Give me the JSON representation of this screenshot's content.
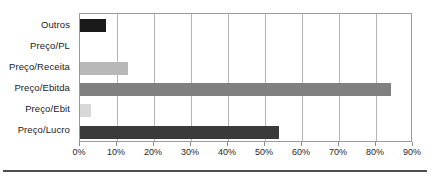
{
  "chart_data": {
    "type": "bar",
    "orientation": "horizontal",
    "title": "",
    "xlabel": "",
    "ylabel": "",
    "categories": [
      "Preço/Lucro",
      "Preço/Ebit",
      "Preço/Ebitda",
      "Preço/Receita",
      "Preço/PL",
      "Outros"
    ],
    "values": [
      53.8,
      3.0,
      84.0,
      13.0,
      0.0,
      7.0
    ],
    "bar_colors": [
      "#3a3a3a",
      "#d8d8d8",
      "#808080",
      "#b8b8b8",
      "#ffffff",
      "#1a1a1a"
    ],
    "xlim": [
      0,
      90
    ],
    "xticks": [
      0,
      10,
      20,
      30,
      40,
      50,
      60,
      70,
      80,
      90
    ],
    "xtick_labels": [
      "0%",
      "10%",
      "20%",
      "30%",
      "40%",
      "50%",
      "60%",
      "70%",
      "80%",
      "90%"
    ],
    "grid": true,
    "grid_axis": "x",
    "legend": false,
    "display_order_top_to_bottom": [
      "Outros",
      "Preço/PL",
      "Preço/Receita",
      "Preço/Ebitda",
      "Preço/Ebit",
      "Preço/Lucro"
    ]
  },
  "axis": {
    "y_labels": [
      "Outros",
      "Preço/PL",
      "Preço/Receita",
      "Preço/Ebitda",
      "Preço/Ebit",
      "Preço/Lucro"
    ],
    "x_labels": [
      "0%",
      "10%",
      "20%",
      "30%",
      "40%",
      "50%",
      "60%",
      "70%",
      "80%",
      "90%"
    ]
  },
  "style": {
    "frame_color": "#9a9a9a",
    "grid_color": "#b4b4b4",
    "background": "#ffffff",
    "rule_color": "#4d4d4d"
  }
}
